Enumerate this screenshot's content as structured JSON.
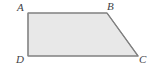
{
  "figure": {
    "type": "geometry-diagram",
    "shape_name": "trapezoid-ABCD",
    "background_color": "#ffffff",
    "fill_color": "#e8e8e8",
    "stroke_color": "#808080",
    "label_color": "#3f3f46",
    "stroke_width": 1.2,
    "canvas": {
      "width": 163,
      "height": 76
    },
    "polygon_points": "28,13 107,13 138,56 28,56",
    "vertices": [
      {
        "id": "A",
        "label": "A",
        "x": 28,
        "y": 13,
        "label_x": 17,
        "label_y": 2
      },
      {
        "id": "B",
        "label": "B",
        "x": 107,
        "y": 13,
        "label_x": 107,
        "label_y": 1
      },
      {
        "id": "C",
        "label": "C",
        "x": 138,
        "y": 56,
        "label_x": 139,
        "label_y": 54
      },
      {
        "id": "D",
        "label": "D",
        "x": 28,
        "y": 56,
        "label_x": 16,
        "label_y": 54
      }
    ],
    "edges": [
      {
        "id": "AB",
        "from": "A",
        "to": "B"
      },
      {
        "id": "BC",
        "from": "B",
        "to": "C"
      },
      {
        "id": "CD",
        "from": "C",
        "to": "D"
      },
      {
        "id": "DA",
        "from": "D",
        "to": "A"
      }
    ]
  }
}
